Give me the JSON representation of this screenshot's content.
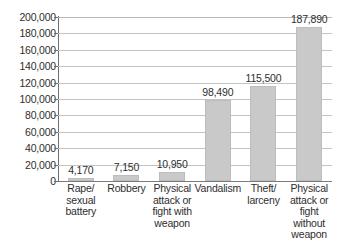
{
  "chart_data": {
    "type": "bar",
    "title": "",
    "subtitle": "",
    "xlabel": "",
    "ylabel": "",
    "ylim": [
      0,
      200000
    ],
    "ytick_step": 20000,
    "grid": true,
    "legend": null,
    "orientation": "vertical",
    "categories": [
      "Rape/ sexual battery",
      "Robbery",
      "Physical attack or fight with weapon",
      "Vandalism",
      "Theft/ larceny",
      "Physical attack or fight without weapon"
    ],
    "category_lines": [
      [
        "Rape/",
        "sexual",
        "battery"
      ],
      [
        "Robbery"
      ],
      [
        "Physical",
        "attack or",
        "fight with",
        "weapon"
      ],
      [
        "Vandalism"
      ],
      [
        "Theft/",
        "larceny"
      ],
      [
        "Physical",
        "attack or",
        "fight",
        "without",
        "weapon"
      ]
    ],
    "values": [
      4170,
      7150,
      10950,
      98490,
      115500,
      187890
    ],
    "value_labels": [
      "4,170",
      "7,150",
      "10,950",
      "98,490",
      "115,500",
      "187,890"
    ],
    "ytick_labels": [
      "200,000",
      "180,000",
      "160,000",
      "140,000",
      "120,000",
      "100,000",
      "80,000",
      "60,000",
      "40,000",
      "20,000",
      "0"
    ],
    "ytick_values": [
      200000,
      180000,
      160000,
      140000,
      120000,
      100000,
      80000,
      60000,
      40000,
      20000,
      0
    ],
    "colors": {
      "bar_fill": "#c9c9c9",
      "bar_stroke": "#bdbdbd",
      "gridline": "#c4c4c4",
      "axis": "#6e6e6e",
      "text": "#2e2e2e",
      "background": "#ffffff"
    }
  }
}
